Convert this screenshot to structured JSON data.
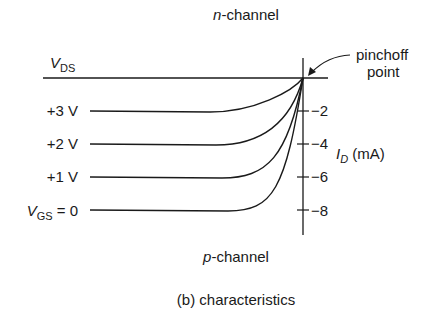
{
  "title_top": {
    "italic": "n",
    "rest": "-channel"
  },
  "title_bottom": {
    "italic": "p",
    "rest": "-channel"
  },
  "caption": "(b) characteristics",
  "x_axis_label": {
    "main": "V",
    "sub": "DS"
  },
  "y_axis_label": {
    "main": "I",
    "sub": "D",
    "unit": " (mA)"
  },
  "annotation": {
    "line1": "pinchoff",
    "line2": "point"
  },
  "curves": [
    {
      "label": "+3 V",
      "saturation_current_mA": -2
    },
    {
      "label": "+2 V",
      "saturation_current_mA": -4
    },
    {
      "label": "+1 V",
      "saturation_current_mA": -6
    },
    {
      "label_main": "V",
      "label_sub": "GS",
      "label_rest": " = 0",
      "saturation_current_mA": -8
    }
  ],
  "y_ticks": [
    "−2",
    "−4",
    "−6",
    "−8"
  ],
  "colors": {
    "line": "#1a1a1a",
    "background": "#ffffff"
  }
}
